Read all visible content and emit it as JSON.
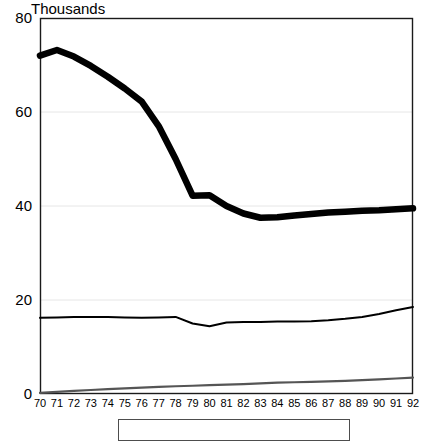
{
  "chart_data": {
    "type": "line",
    "title": "Thousands",
    "xlabel": "",
    "ylabel": "",
    "ylim": [
      0,
      80
    ],
    "yticks": [
      0,
      20,
      40,
      60,
      80
    ],
    "grid": "horizontal-light",
    "legend_position": "bottom",
    "x": [
      70,
      71,
      72,
      73,
      74,
      75,
      76,
      77,
      78,
      79,
      80,
      81,
      82,
      83,
      84,
      85,
      86,
      87,
      88,
      89,
      90,
      91,
      92
    ],
    "xtick_labels": [
      "70",
      "71",
      "72",
      "73",
      "74",
      "75",
      "76",
      "77",
      "78",
      "79",
      "80",
      "81",
      "82",
      "83",
      "84",
      "85",
      "86",
      "87",
      "88",
      "89",
      "90",
      "91",
      "92"
    ],
    "series": [
      {
        "name": "series-thick",
        "style": "thick-solid-black",
        "color": "#000000",
        "width": 6.5,
        "values": [
          72.0,
          73.2,
          71.8,
          69.8,
          67.5,
          65.0,
          62.2,
          57.0,
          50.0,
          42.2,
          42.3,
          40.0,
          38.4,
          37.5,
          37.6,
          38.0,
          38.3,
          38.6,
          38.8,
          39.0,
          39.1,
          39.3,
          39.5
        ]
      },
      {
        "name": "series-middle",
        "style": "thin-solid-black",
        "color": "#000000",
        "width": 2.0,
        "values": [
          16.2,
          16.3,
          16.4,
          16.4,
          16.4,
          16.3,
          16.2,
          16.3,
          16.4,
          15.0,
          14.4,
          15.2,
          15.3,
          15.3,
          15.4,
          15.4,
          15.5,
          15.7,
          16.0,
          16.4,
          17.0,
          17.8,
          18.5
        ]
      },
      {
        "name": "series-bottom",
        "style": "thin-grey",
        "color": "#555555",
        "width": 2.2,
        "values": [
          0.25,
          0.45,
          0.65,
          0.85,
          1.05,
          1.2,
          1.35,
          1.5,
          1.65,
          1.75,
          1.9,
          2.0,
          2.1,
          2.25,
          2.4,
          2.5,
          2.6,
          2.7,
          2.8,
          2.95,
          3.1,
          3.3,
          3.5
        ]
      }
    ]
  },
  "axes": {
    "plot_left": 40,
    "plot_right": 413,
    "plot_top": 18,
    "plot_bottom": 394
  }
}
